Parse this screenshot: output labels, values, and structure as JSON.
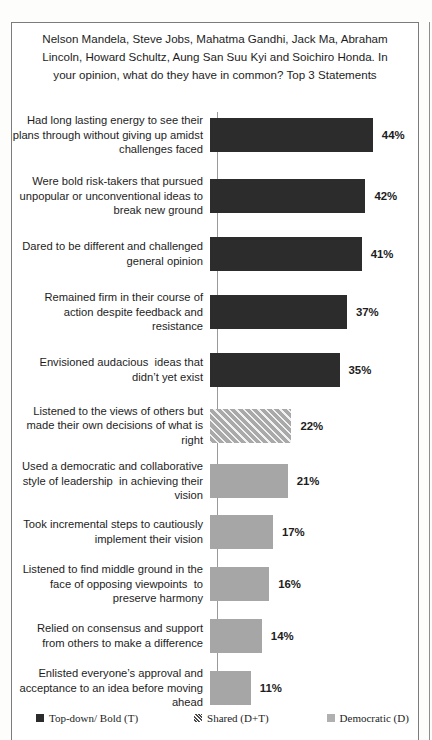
{
  "chart_data": {
    "type": "bar",
    "orientation": "horizontal",
    "title": "Nelson Mandela, Steve Jobs, Mahatma Gandhi, Jack Ma, Abraham Lincoln, Howard Schultz, Aung San Suu Kyi and Soichiro Honda. In your opinion, what do they have in common? Top 3 Statements",
    "xlabel": "",
    "ylabel": "",
    "xlim": [
      0,
      50
    ],
    "grid": false,
    "legend_position": "bottom",
    "value_suffix": "%",
    "categories": [
      "Had long lasting energy to see their plans through without giving up amidst challenges faced",
      "Were bold risk-takers that pursued unpopular or unconventional ideas to break new ground",
      "Dared to be different and challenged general opinion",
      "Remained firm in their course of action despite feedback and resistance",
      "Envisioned audacious  ideas that didn’t yet exist",
      "Listened to the views of others but made their own decisions of what is right",
      "Used a democratic and collaborative style of leadership  in achieving their vision",
      "Took incremental steps to cautiously implement their vision",
      "Listened to find middle ground in the face of opposing viewpoints  to preserve harmony",
      "Relied on consensus and support from others to make a difference",
      "Enlisted everyone’s approval and acceptance to an idea before moving ahead"
    ],
    "values": [
      44,
      42,
      41,
      37,
      35,
      22,
      21,
      17,
      16,
      14,
      11
    ],
    "value_labels": [
      "44%",
      "42%",
      "41%",
      "37%",
      "35%",
      "22%",
      "21%",
      "17%",
      "16%",
      "14%",
      "11%"
    ],
    "series_of_bar": [
      "topdown",
      "topdown",
      "topdown",
      "topdown",
      "topdown",
      "shared",
      "democratic",
      "democratic",
      "democratic",
      "democratic",
      "democratic"
    ],
    "legend": [
      {
        "key": "topdown",
        "label": "Top-down/ Bold (T)",
        "color": "#2c2c2c"
      },
      {
        "key": "shared",
        "label": "Shared (D+T)",
        "color": "#8f8f8f"
      },
      {
        "key": "democratic",
        "label": "Democratic (D)",
        "color": "#b0b0b0"
      }
    ]
  },
  "bars": [
    {
      "label": "Had long lasting energy to see their plans through without giving up amidst challenges faced",
      "value_label": "44%"
    },
    {
      "label": "Were bold risk-takers that pursued unpopular or unconventional ideas to break new ground",
      "value_label": "42%"
    },
    {
      "label": "Dared to be different and challenged general opinion",
      "value_label": "41%"
    },
    {
      "label": "Remained firm in their course of action despite feedback and resistance",
      "value_label": "37%"
    },
    {
      "label": "Envisioned audacious  ideas that didn’t yet exist",
      "value_label": "35%"
    },
    {
      "label": "Listened to the views of others but made their own decisions of what is right",
      "value_label": "22%"
    },
    {
      "label": "Used a democratic and collaborative style of leadership  in achieving their vision",
      "value_label": "21%"
    },
    {
      "label": "Took incremental steps to cautiously implement their vision",
      "value_label": "17%"
    },
    {
      "label": "Listened to find middle ground in the face of opposing viewpoints  to preserve harmony",
      "value_label": "16%"
    },
    {
      "label": "Relied on consensus and support from others to make a difference",
      "value_label": "14%"
    },
    {
      "label": "Enlisted everyone’s approval and acceptance to an idea before moving ahead",
      "value_label": "11%"
    }
  ]
}
